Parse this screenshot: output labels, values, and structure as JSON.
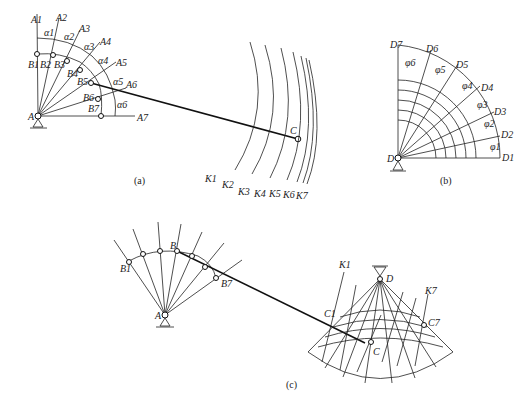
{
  "figure": {
    "panels": [
      {
        "id": "a",
        "caption": "(a)",
        "pivot_label": "A",
        "ray_labels": [
          "A1",
          "A2",
          "A3",
          "A4",
          "A5",
          "A6",
          "A7"
        ],
        "joint_labels": [
          "B1",
          "B2",
          "B3",
          "B4",
          "B5",
          "B6",
          "B7"
        ],
        "angle_labels": [
          "α1",
          "α2",
          "α3",
          "α4",
          "α5",
          "α6"
        ],
        "coupler_point_label": "C",
        "curve_labels": [
          "K1",
          "K2",
          "K3",
          "K4",
          "K5",
          "K6",
          "K7"
        ]
      },
      {
        "id": "b",
        "caption": "(b)",
        "pivot_label": "D",
        "ray_labels": [
          "D1",
          "D2",
          "D3",
          "D4",
          "D5",
          "D6",
          "D7"
        ],
        "angle_labels": [
          "φ1",
          "φ2",
          "φ3",
          "φ4",
          "φ5",
          "φ6"
        ]
      },
      {
        "id": "c",
        "caption": "(c)",
        "crank_pivot_label": "A",
        "joint_labels": [
          "B1",
          "B",
          "B7"
        ],
        "rocker_pivot_label": "D",
        "coupler_labels": [
          "C1",
          "C",
          "C7"
        ],
        "curve_labels": [
          "K1",
          "K7"
        ]
      }
    ]
  }
}
